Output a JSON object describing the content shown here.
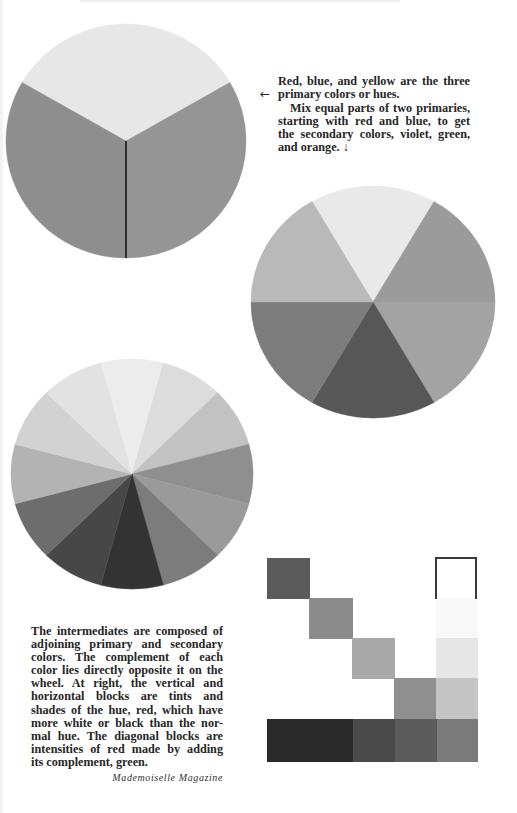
{
  "page": {
    "background": "#ffffff",
    "text_color": "#262626"
  },
  "captions": {
    "top": {
      "arrow_left": "←",
      "lines": [
        "Red, blue, and yellow are the three",
        "primary colors or hues.",
        "Mix equal parts of two primaries,",
        "starting with red and blue, to get",
        "the secondary colors, violet, green,",
        "and orange. ↓"
      ]
    },
    "bottom": {
      "lines": [
        "The intermediates are composed of",
        "adjoining primary and secondary",
        "colors. The complement of each",
        "color lies directly opposite it on the",
        "wheel. At right, the vertical and",
        "horizontal blocks are tints and",
        "shades of the hue, red, which have",
        "more white or black than the nor-",
        "mal hue. The diagonal blocks are",
        "intensities of red made by adding",
        "its complement, green."
      ]
    },
    "credit": "Mademoiselle Magazine"
  },
  "wheels": [
    {
      "name": "primary-wheel",
      "label": "Primary colors",
      "cx": 126,
      "cy": 141,
      "rx": 120,
      "ry": 117,
      "start_angle": -60,
      "segment_sizes": [
        120,
        120,
        120
      ],
      "segments": [
        {
          "hue": "yellow",
          "color": "#e7e7e7"
        },
        {
          "hue": "blue",
          "color": "#959595"
        },
        {
          "hue": "red",
          "color": "#8e8e8e"
        }
      ],
      "divider": {
        "color": "#2e2e2e",
        "from_angle": 180
      }
    },
    {
      "name": "secondary-wheel",
      "label": "Primary and secondary colors",
      "cx": 373,
      "cy": 302,
      "rx": 122,
      "ry": 116,
      "start_angle": -30,
      "segment_sizes": [
        60,
        60,
        60,
        60,
        60,
        60
      ],
      "segments": [
        {
          "hue": "yellow",
          "color": "#e9e9e9"
        },
        {
          "hue": "green",
          "color": "#9b9b9b"
        },
        {
          "hue": "blue",
          "color": "#a3a3a3"
        },
        {
          "hue": "violet",
          "color": "#575757"
        },
        {
          "hue": "red",
          "color": "#7c7c7c"
        },
        {
          "hue": "orange",
          "color": "#b9b9b9"
        }
      ]
    },
    {
      "name": "intermediate-wheel",
      "label": "Twelve-hue wheel",
      "cx": 132,
      "cy": 474,
      "rx": 121,
      "ry": 115,
      "start_angle": -15,
      "segment_sizes": [
        30,
        30,
        30,
        30,
        30,
        30,
        30,
        30,
        30,
        30,
        30,
        30
      ],
      "segments": [
        {
          "hue": "yellow",
          "color": "#ececec"
        },
        {
          "hue": "yellow-green",
          "color": "#dcdcdc"
        },
        {
          "hue": "green",
          "color": "#c2c2c2"
        },
        {
          "hue": "blue-green",
          "color": "#8f8f8f"
        },
        {
          "hue": "blue",
          "color": "#9a9a9a"
        },
        {
          "hue": "blue-violet",
          "color": "#7c7c7c"
        },
        {
          "hue": "violet",
          "color": "#333333"
        },
        {
          "hue": "red-violet",
          "color": "#474747"
        },
        {
          "hue": "red",
          "color": "#6d6d6d"
        },
        {
          "hue": "red-orange",
          "color": "#b3b3b3"
        },
        {
          "hue": "orange",
          "color": "#d2d2d2"
        },
        {
          "hue": "yellow-orange",
          "color": "#e2e2e2"
        }
      ]
    }
  ],
  "blocks": {
    "outline_box": {
      "x": 435,
      "y": 557,
      "w": 42,
      "h": 42,
      "color": "#3a3a3a"
    },
    "diagonal": [
      {
        "x": 267,
        "y": 558,
        "w": 43,
        "h": 41,
        "color": "#5b5b5b",
        "label": "intensity 1"
      },
      {
        "x": 309,
        "y": 598,
        "w": 44,
        "h": 41,
        "color": "#8b8b8b",
        "label": "intensity 2"
      },
      {
        "x": 352,
        "y": 638,
        "w": 43,
        "h": 41,
        "color": "#a9a9a9",
        "label": "intensity 3"
      },
      {
        "x": 394,
        "y": 678,
        "w": 43,
        "h": 41,
        "color": "#8f8f8f",
        "label": "intensity 4"
      }
    ],
    "tints_column": [
      {
        "x": 436,
        "y": 598,
        "w": 42,
        "h": 41,
        "color": "#f8f8f8",
        "label": "tint 1"
      },
      {
        "x": 436,
        "y": 638,
        "w": 42,
        "h": 41,
        "color": "#e6e6e6",
        "label": "tint 2"
      },
      {
        "x": 436,
        "y": 678,
        "w": 42,
        "h": 41,
        "color": "#c5c5c5",
        "label": "tint 3"
      }
    ],
    "shades_row": [
      {
        "x": 267,
        "y": 719,
        "w": 86,
        "h": 43,
        "color": "#2b2b2b",
        "label": "shade 1"
      },
      {
        "x": 353,
        "y": 719,
        "w": 42,
        "h": 43,
        "color": "#4a4a4a",
        "label": "shade 2"
      },
      {
        "x": 395,
        "y": 719,
        "w": 42,
        "h": 43,
        "color": "#5c5c5c",
        "label": "shade 3"
      },
      {
        "x": 437,
        "y": 719,
        "w": 41,
        "h": 43,
        "color": "#7a7a7a",
        "label": "shade 4"
      }
    ]
  }
}
